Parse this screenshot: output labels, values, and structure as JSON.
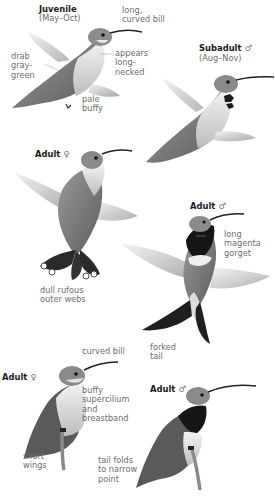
{
  "plate": {
    "species_sections": [
      {
        "id": "juvenile",
        "title": "Juvenile",
        "subtitle": "(May–Oct)",
        "annotations": [
          "long,\ncurved bill",
          "drab\ngray-\ngreen",
          "appears\nlong-\nnecked",
          "pale\nbuffy"
        ]
      },
      {
        "id": "subadult-male",
        "title": "Subadult",
        "sex_symbol": "♂",
        "subtitle": "(Aug–Nov)",
        "annotations": []
      },
      {
        "id": "adult-female-flying",
        "title": "Adult",
        "sex_symbol": "♀",
        "annotations": [
          "dull rufous\nouter webs"
        ]
      },
      {
        "id": "adult-male-flying",
        "title": "Adult",
        "sex_symbol": "♂",
        "annotations": [
          "long\nmagenta\ngorget",
          "forked\ntail"
        ]
      },
      {
        "id": "adult-female-perched",
        "title": "Adult",
        "sex_symbol": "♀",
        "annotations": [
          "curved bill",
          "buffy\nsupercilium\nand\nbreastband",
          "short\nwings",
          "tail folds\nto narrow\npoint"
        ]
      },
      {
        "id": "adult-male-perched",
        "title": "Adult",
        "sex_symbol": "♂",
        "annotations": []
      }
    ]
  },
  "colors": {
    "background": "#ffffff",
    "label_text": "#6e6e6e",
    "title_text": "#1a1a1a",
    "gorget": "#141414",
    "body_gray": "#8a8a8a",
    "wing_gray": "#c8c8c8"
  }
}
